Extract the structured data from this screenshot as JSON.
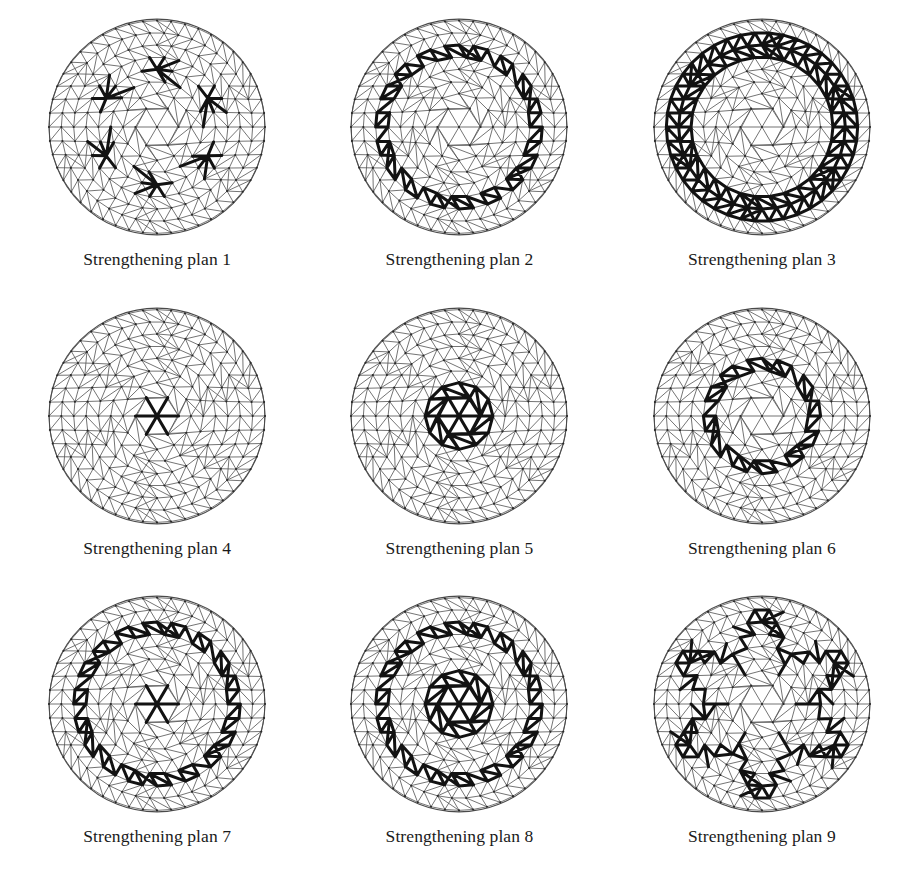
{
  "figure": {
    "columns": 3,
    "rows": 3,
    "background_color": "#ffffff",
    "mesh_color": "#5b5b5b",
    "highlight_color": "#121212",
    "rim_color": "#4a4a4a"
  },
  "mesh": {
    "type": "geodesic triangulated circular dome grid",
    "symmetry": 6,
    "rings": 8,
    "radius": 108,
    "center": [
      120,
      119
    ],
    "description": "Hexagonal geodesic lattice of a shallow circular dome, projected in plan; radial ribs, circumferential hoops and diagonal bracing form triangles."
  },
  "panels": [
    {
      "id": 1,
      "caption": "Strengthening plan 1",
      "pattern": "six-point-nodes",
      "pattern_label": "Six reinforced star nodes on ring 4 (hexagonal arrangement)",
      "params": {
        "ring": 4,
        "count": 6,
        "angle_offset": 90
      }
    },
    {
      "id": 2,
      "caption": "Strengthening plan 2",
      "pattern": "outer-zigzag-ring",
      "pattern_label": "Zigzag reinforced band between rings 5 and 6",
      "params": {
        "inner_ring": 5,
        "outer_ring": 6
      }
    },
    {
      "id": 3,
      "caption": "Strengthening plan 3",
      "pattern": "outer-annulus",
      "pattern_label": "Fully reinforced outer annulus, rings 5 to 7",
      "params": {
        "inner_ring": 5,
        "outer_ring": 7
      }
    },
    {
      "id": 4,
      "caption": "Strengthening plan 4",
      "pattern": "center-star",
      "pattern_label": "Reinforced central node star (six radial members)",
      "params": {
        "ring": 1
      }
    },
    {
      "id": 5,
      "caption": "Strengthening plan 5",
      "pattern": "center-disc",
      "pattern_label": "Fully reinforced central disc, rings 0 to 2",
      "params": {
        "inner_ring": 0,
        "outer_ring": 2
      }
    },
    {
      "id": 6,
      "caption": "Strengthening plan 6",
      "pattern": "mid-zigzag-ring",
      "pattern_label": "Zigzag reinforced band between rings 3 and 4",
      "params": {
        "inner_ring": 3,
        "outer_ring": 4
      }
    },
    {
      "id": 7,
      "caption": "Strengthening plan 7",
      "pattern": "outer-zigzag-ring-plus-center-star",
      "pattern_label": "Plan 2 outer zigzag band combined with plan 4 central star",
      "params": {
        "inner_ring": 5,
        "outer_ring": 6,
        "center_ring": 1
      }
    },
    {
      "id": 8,
      "caption": "Strengthening plan 8",
      "pattern": "outer-zigzag-ring-plus-center-disc",
      "pattern_label": "Plan 2 outer zigzag band combined with plan 5 central disc",
      "params": {
        "inner_ring": 5,
        "outer_ring": 6,
        "center_inner": 0,
        "center_outer": 2
      }
    },
    {
      "id": 9,
      "caption": "Strengthening plan 9",
      "pattern": "large-six-point-star",
      "pattern_label": "Large six-pointed star outline spanning rings 3 to 7",
      "params": {
        "inner_ring": 3,
        "outer_ring": 7,
        "points": 6
      }
    }
  ]
}
